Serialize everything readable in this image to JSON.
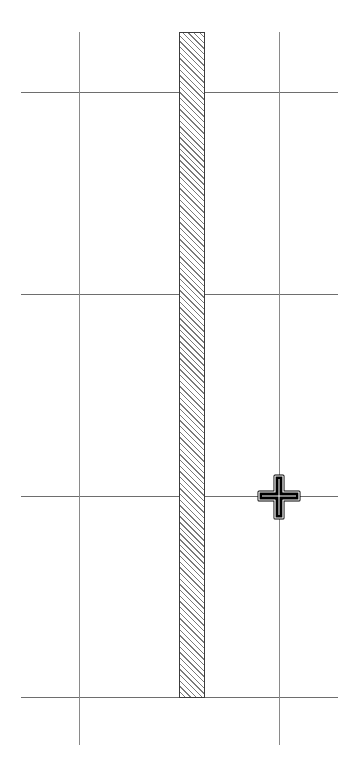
{
  "canvas": {
    "background": "#ffffff",
    "grid": {
      "line_color": "#6e6e6e",
      "horizontal_lines_y": [
        92,
        294,
        496,
        697
      ],
      "horizontal_span_x": [
        21,
        338
      ],
      "vertical_lines_x": [
        79,
        279
      ],
      "vertical_span_y": [
        32,
        745
      ]
    },
    "wall": {
      "x": 179,
      "y": 32,
      "width": 26,
      "height": 665,
      "fill": "hatched",
      "stroke": "#3c3c3c"
    }
  },
  "cursor": {
    "icon": "move-cursor-icon",
    "x": 279,
    "y": 496
  }
}
